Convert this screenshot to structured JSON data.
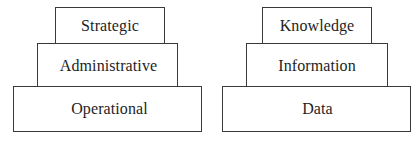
{
  "diagrams": [
    {
      "name": "management-levels-pyramid",
      "tiers": [
        {
          "label": "Strategic"
        },
        {
          "label": "Administrative"
        },
        {
          "label": "Operational"
        }
      ]
    },
    {
      "name": "dikw-pyramid",
      "tiers": [
        {
          "label": "Knowledge"
        },
        {
          "label": "Information"
        },
        {
          "label": "Data"
        }
      ]
    }
  ],
  "colors": {
    "border": "#3a3a3a",
    "text": "#1e1e1e",
    "background": "#ffffff"
  }
}
